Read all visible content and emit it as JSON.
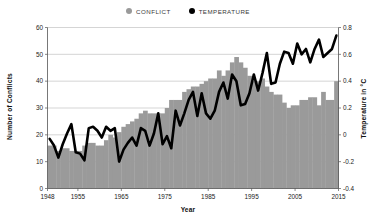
{
  "legend": {
    "items": [
      {
        "label": "CONFLICT",
        "color": "#9a9a9a",
        "marker": "circle-icon"
      },
      {
        "label": "TEMPERATURE",
        "color": "#000000",
        "marker": "circle-icon"
      }
    ]
  },
  "chart_data": {
    "type": "bar",
    "title": "",
    "xlabel": "Year",
    "ylabel": "Number of Conflicts",
    "y2label": "Temperature in °C",
    "grid": true,
    "legend_position": "top-center",
    "xlim": [
      1948,
      2015
    ],
    "ylim": [
      0,
      60
    ],
    "y2lim": [
      -0.4,
      0.8
    ],
    "yticks": [
      0,
      10,
      20,
      30,
      40,
      50,
      60
    ],
    "y2ticks": [
      -0.4,
      -0.2,
      0,
      0.2,
      0.4,
      0.6,
      0.8
    ],
    "xticks": [
      1948,
      1955,
      1965,
      1975,
      1985,
      1995,
      2005,
      2015
    ],
    "x": [
      1948,
      1949,
      1950,
      1951,
      1952,
      1953,
      1954,
      1955,
      1956,
      1957,
      1958,
      1959,
      1960,
      1961,
      1962,
      1963,
      1964,
      1965,
      1966,
      1967,
      1968,
      1969,
      1970,
      1971,
      1972,
      1973,
      1974,
      1975,
      1976,
      1977,
      1978,
      1979,
      1980,
      1981,
      1982,
      1983,
      1984,
      1985,
      1986,
      1987,
      1988,
      1989,
      1990,
      1991,
      1992,
      1993,
      1994,
      1995,
      1996,
      1997,
      1998,
      1999,
      2000,
      2001,
      2002,
      2003,
      2004,
      2005,
      2006,
      2007,
      2008,
      2009,
      2010,
      2011,
      2012,
      2013,
      2014
    ],
    "series": [
      {
        "name": "CONFLICT",
        "axis": "left",
        "type": "bar",
        "color": "#9a9a9a",
        "values": [
          16,
          16,
          14,
          15,
          15,
          14,
          14,
          14,
          16,
          17,
          17,
          16,
          16,
          18,
          20,
          19,
          21,
          23,
          24,
          25,
          26,
          28,
          29,
          28,
          28,
          28,
          28,
          30,
          33,
          33,
          33,
          36,
          37,
          38,
          38,
          39,
          40,
          41,
          41,
          44,
          42,
          44,
          47,
          49,
          47,
          45,
          42,
          40,
          40,
          41,
          38,
          36,
          35,
          35,
          32,
          30,
          31,
          31,
          33,
          33,
          34,
          34,
          31,
          36,
          33,
          33,
          40
        ]
      },
      {
        "name": "TEMPERATURE",
        "axis": "right",
        "type": "line",
        "color": "#000000",
        "values": [
          -0.03,
          -0.08,
          -0.17,
          -0.07,
          0.01,
          0.08,
          -0.13,
          -0.14,
          -0.19,
          0.05,
          0.06,
          0.03,
          -0.02,
          0.06,
          0.03,
          0.05,
          -0.2,
          -0.11,
          -0.06,
          -0.02,
          -0.08,
          0.05,
          0.03,
          -0.08,
          0.01,
          0.16,
          -0.07,
          -0.01,
          -0.1,
          0.18,
          0.07,
          0.16,
          0.26,
          0.32,
          0.14,
          0.31,
          0.16,
          0.12,
          0.18,
          0.32,
          0.39,
          0.27,
          0.45,
          0.4,
          0.22,
          0.23,
          0.31,
          0.45,
          0.33,
          0.46,
          0.61,
          0.38,
          0.39,
          0.53,
          0.62,
          0.61,
          0.53,
          0.68,
          0.6,
          0.64,
          0.54,
          0.64,
          0.71,
          0.58,
          0.61,
          0.64,
          0.74
        ]
      }
    ]
  }
}
